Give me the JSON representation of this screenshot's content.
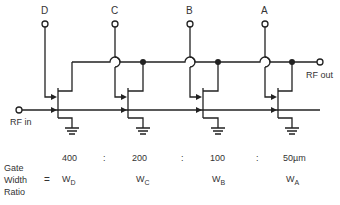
{
  "terminals": {
    "control": [
      {
        "label": "D",
        "x": 45
      },
      {
        "label": "C",
        "x": 115
      },
      {
        "label": "B",
        "x": 190
      },
      {
        "label": "A",
        "x": 265
      }
    ],
    "rf_in": "RF in",
    "rf_out": "RF out"
  },
  "ratio": {
    "heading_line1": "Gate",
    "heading_line2": "Width",
    "heading_line3": "Ratio",
    "equals": "=",
    "values": [
      "400",
      "200",
      "100",
      "50µm"
    ],
    "separator": ":",
    "w_symbols": [
      {
        "base": "W",
        "sub": "D"
      },
      {
        "base": "W",
        "sub": "C"
      },
      {
        "base": "W",
        "sub": "B"
      },
      {
        "base": "W",
        "sub": "A"
      }
    ]
  },
  "colors": {
    "line": "#222222",
    "text": "#333333"
  }
}
